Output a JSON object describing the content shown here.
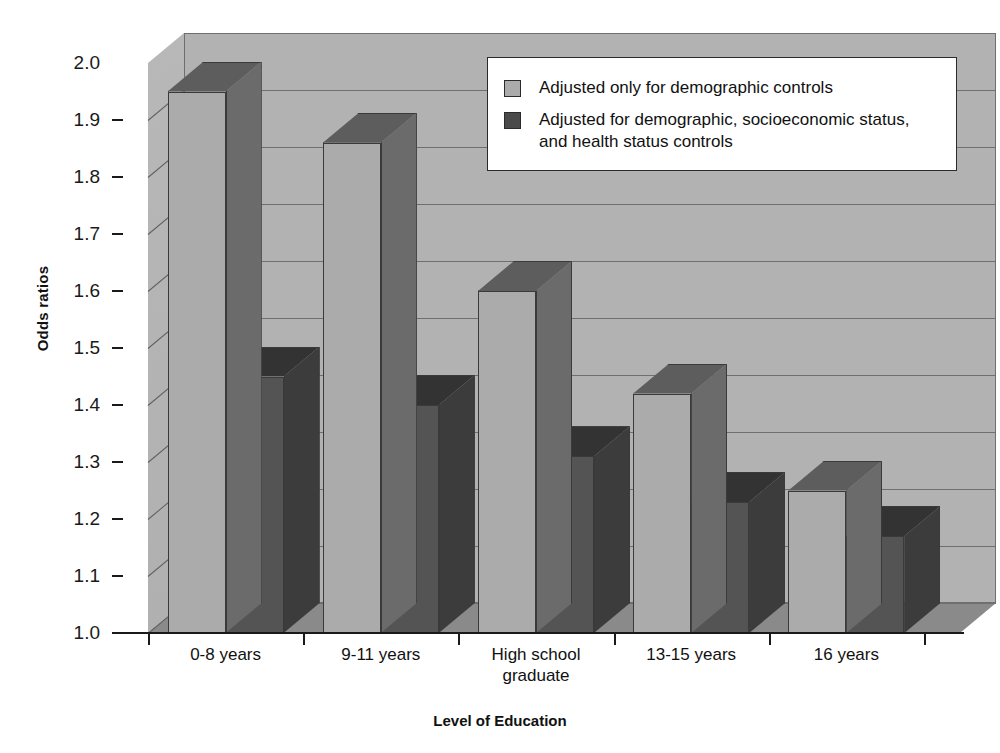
{
  "chart_data": {
    "type": "bar",
    "title": "",
    "xlabel": "Level of Education",
    "ylabel": "Odds ratios",
    "ylim": [
      1.0,
      2.0
    ],
    "ytick_step": 0.1,
    "grid": true,
    "legend_position": "top-right",
    "style": "3d-clustered-column",
    "categories": [
      "0-8 years",
      "9-11 years",
      "High school graduate",
      "13-15 years",
      "16 years"
    ],
    "category_lines": [
      [
        "0-8 years"
      ],
      [
        "9-11 years"
      ],
      [
        "High school",
        "graduate"
      ],
      [
        "13-15 years"
      ],
      [
        "16 years"
      ]
    ],
    "yticks": [
      "2.0",
      "1.9",
      "1.8",
      "1.7",
      "1.6",
      "1.5",
      "1.4",
      "1.3",
      "1.2",
      "1.1",
      "1.0"
    ],
    "ytick_values": [
      2.0,
      1.9,
      1.8,
      1.7,
      1.6,
      1.5,
      1.4,
      1.3,
      1.2,
      1.1,
      1.0
    ],
    "series": [
      {
        "name": "Adjusted only for demographic controls",
        "color": "#ababab",
        "values": [
          1.95,
          1.86,
          1.6,
          1.42,
          1.25
        ]
      },
      {
        "name": "Adjusted for demographic, socioeconomic status, and health status controls",
        "color": "#545454",
        "values": [
          1.45,
          1.4,
          1.31,
          1.23,
          1.17
        ]
      }
    ]
  },
  "legend": {
    "items": [
      {
        "label": "Adjusted only for demographic controls",
        "swatch": "light"
      },
      {
        "label": "Adjusted for demographic, socioeconomic status, and health status controls",
        "swatch": "dark"
      }
    ]
  },
  "colors": {
    "series_light": "#ababab",
    "series_dark": "#545454",
    "plot_background": "#b2b2b2",
    "floor": "#8a8a8a",
    "axis": "#1a1a1a",
    "gridline": "#6f6f6f"
  }
}
